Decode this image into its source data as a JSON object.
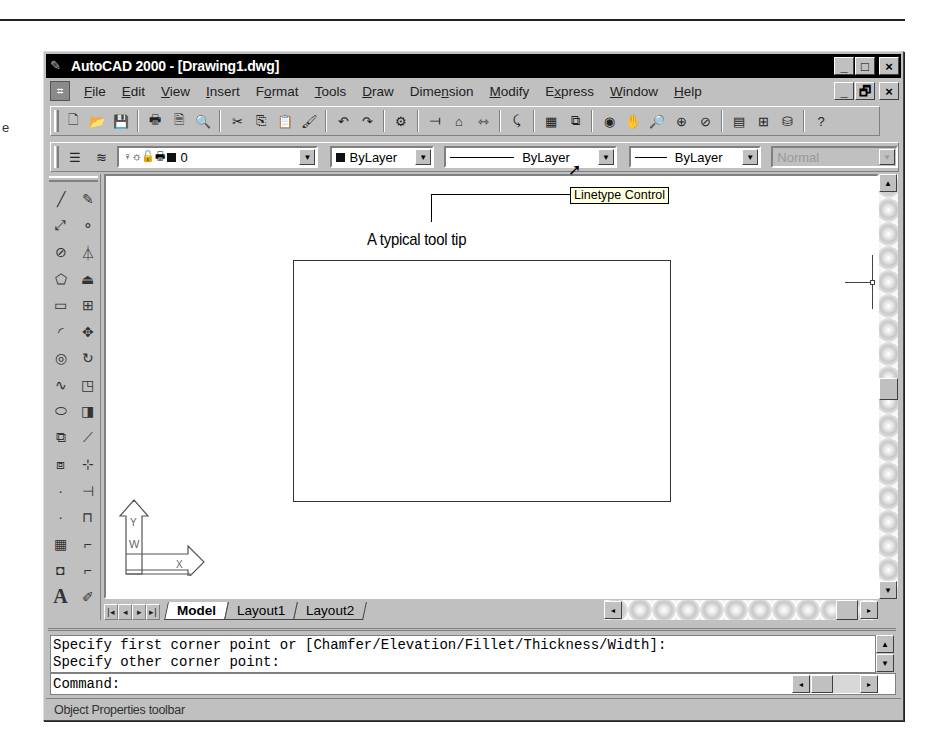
{
  "page": {
    "stray_glyph": "e"
  },
  "window": {
    "title": "AutoCAD 2000 - [Drawing1.dwg]",
    "app_buttons": [
      "_",
      "□",
      "×"
    ],
    "doc_buttons": [
      "_",
      "🗗",
      "×"
    ]
  },
  "menu": {
    "items": [
      {
        "label": "File",
        "ul": "F"
      },
      {
        "label": "Edit",
        "ul": "E"
      },
      {
        "label": "View",
        "ul": "V"
      },
      {
        "label": "Insert",
        "ul": "I"
      },
      {
        "label": "Format",
        "ul": "o"
      },
      {
        "label": "Tools",
        "ul": "T"
      },
      {
        "label": "Draw",
        "ul": "D"
      },
      {
        "label": "Dimension",
        "ul": "n"
      },
      {
        "label": "Modify",
        "ul": "M"
      },
      {
        "label": "Express",
        "ul": "x"
      },
      {
        "label": "Window",
        "ul": "W"
      },
      {
        "label": "Help",
        "ul": "H"
      }
    ]
  },
  "standard_toolbar": {
    "icons": [
      "new-icon",
      "open-icon",
      "save-icon",
      "|",
      "plot-icon",
      "plot-preview-icon",
      "find-icon",
      "|",
      "cut-icon",
      "copy-icon",
      "paste-icon",
      "match-properties-icon",
      "|",
      "undo-icon",
      "redo-icon",
      "|",
      "cad-standards-icon",
      "|",
      "ucs-icon",
      "insert-block-icon",
      "distance-icon",
      "|",
      "redraw-icon",
      "|",
      "named-views-icon",
      "zoom-window-icon",
      "|",
      "3d-orbit-icon",
      "pan-icon",
      "zoom-realtime-icon",
      "zoom-window2-icon",
      "zoom-previous-icon",
      "|",
      "properties-icon",
      "design-center-icon",
      "dbconnect-icon",
      "|",
      "help-icon"
    ],
    "glyphs": [
      "🗋",
      "📂",
      "💾",
      "|",
      "🖶",
      "🗎",
      "🔍",
      "|",
      "✂",
      "⎘",
      "📋",
      "🖌",
      "|",
      "↶",
      "↷",
      "|",
      "⚙",
      "|",
      "⟞",
      "⌂",
      "⇿",
      "|",
      "⤹",
      "|",
      "▦",
      "⧉",
      "|",
      "◉",
      "✋",
      "🔎",
      "⊕",
      "⊘",
      "|",
      "▤",
      "⊞",
      "⛁",
      "|",
      "?"
    ]
  },
  "properties_toolbar": {
    "layer_icons": [
      "layer-manager-icon",
      "layer-previous-icon"
    ],
    "layer_glyphs": [
      "☰",
      "≋"
    ],
    "layer_state_glyphs": "♀☼🔓🖶",
    "layer_value": "0",
    "color_value": "ByLayer",
    "linetype_value": "ByLayer",
    "lineweight_value": "ByLayer",
    "plotstyle_value": "Normal",
    "tooltip": "Linetype Control"
  },
  "draw_toolbar": {
    "left": [
      "line-icon",
      "construction-line-icon",
      "polyline-icon",
      "polygon-icon",
      "rectangle-icon",
      "arc-icon",
      "circle-icon",
      "spline-icon",
      "ellipse-icon",
      "insert-block-icon",
      "make-block-icon",
      "point-icon",
      "hatch-icon",
      "region-icon",
      "mtext-icon"
    ],
    "left_glyphs": [
      "╱",
      "⤢",
      "⊘",
      "⬠",
      "▭",
      "◜",
      "◎",
      "∿",
      "⬭",
      "⧉",
      "⧈",
      "·",
      "▦",
      "◘",
      "A"
    ],
    "right": [
      "erase-icon",
      "copy-object-icon",
      "mirror-icon",
      "offset-icon",
      "array-icon",
      "move-icon",
      "rotate-icon",
      "scale-icon",
      "stretch-icon",
      "lengthen-icon",
      "trim-icon",
      "extend-icon",
      "break-icon",
      "chamfer-icon",
      "fillet-icon",
      "explode-icon"
    ],
    "right_glyphs": [
      "✎",
      "⚬",
      "⏃",
      "⏏",
      "⊞",
      "✥",
      "↻",
      "◳",
      "◨",
      "⟋",
      "⊹",
      "⊣",
      "⊓",
      "⌐",
      "⌐",
      "✐"
    ]
  },
  "annotation": {
    "callout": "A typical tool tip"
  },
  "tabs": {
    "nav": [
      "|◂",
      "◂",
      "▸",
      "▸|"
    ],
    "items": [
      {
        "label": "Model",
        "active": true
      },
      {
        "label": "Layout1",
        "active": false
      },
      {
        "label": "Layout2",
        "active": false
      }
    ]
  },
  "command": {
    "history": [
      "Specify first corner point or [Chamfer/Elevation/Fillet/Thickness/Width]:",
      "Specify other corner point:"
    ],
    "prompt": "Command:"
  },
  "status": {
    "text": "Object Properties toolbar"
  },
  "scroll": {
    "up": "▲",
    "down": "▼",
    "left": "◂",
    "right": "▸"
  }
}
